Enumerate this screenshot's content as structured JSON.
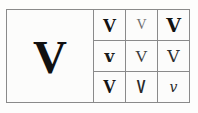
{
  "figure": {
    "name": "letter-v-glyph-variants",
    "background_color": "#fdfdfc",
    "border_color": "#8a8a8a"
  },
  "specimen": {
    "letter": "V",
    "style": "bold-serif-large",
    "color": "#111111"
  },
  "grid": {
    "rows": 3,
    "columns": 3,
    "cells": [
      [
        {
          "glyph": "V",
          "style": "bold-heavy"
        },
        {
          "glyph": "V",
          "style": "light-small"
        },
        {
          "glyph": "V",
          "style": "bold-wide"
        }
      ],
      [
        {
          "glyph": "v",
          "style": "bold-compact"
        },
        {
          "glyph": "V",
          "style": "regular"
        },
        {
          "glyph": "V",
          "style": "regular-dark"
        }
      ],
      [
        {
          "glyph": "V",
          "style": "bold-serif"
        },
        {
          "glyph": "V",
          "style": "condensed"
        },
        {
          "glyph": "𝑣",
          "style": "script-small"
        }
      ]
    ]
  }
}
